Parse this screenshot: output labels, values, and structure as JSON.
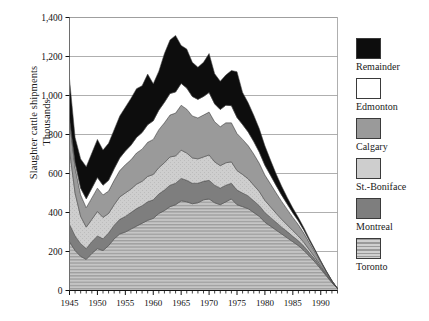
{
  "chart_data": {
    "type": "area",
    "stacked": true,
    "title": "",
    "xlabel": "",
    "ylabel": "Slaughter cattle shipments Thousands",
    "ylabel_lines": [
      "Slaughter cattle shipments",
      "Thousands"
    ],
    "xlim": [
      1945,
      1993
    ],
    "ylim": [
      0,
      1400
    ],
    "ytick_step": 200,
    "xtick_step_major": 5,
    "xtick_step_minor": 1,
    "grid": true,
    "legend_position": "right",
    "ytick_labels": [
      "0",
      "200",
      "400",
      "600",
      "800",
      "1,000",
      "1,200",
      "1,400"
    ],
    "ytick_values": [
      0,
      200,
      400,
      600,
      800,
      1000,
      1200,
      1400
    ],
    "xtick_labels": [
      "1945",
      "1950",
      "1955",
      "1960",
      "1965",
      "1970",
      "1975",
      "1980",
      "1985",
      "1990"
    ],
    "xtick_values": [
      1945,
      1950,
      1955,
      1960,
      1965,
      1970,
      1975,
      1980,
      1985,
      1990
    ],
    "x": [
      1945,
      1946,
      1947,
      1948,
      1949,
      1950,
      1951,
      1952,
      1953,
      1954,
      1955,
      1956,
      1957,
      1958,
      1959,
      1960,
      1961,
      1962,
      1963,
      1964,
      1965,
      1966,
      1967,
      1968,
      1969,
      1970,
      1971,
      1972,
      1973,
      1974,
      1975,
      1976,
      1977,
      1978,
      1979,
      1980,
      1981,
      1982,
      1983,
      1984,
      1985,
      1986,
      1987,
      1988,
      1989,
      1990,
      1991,
      1992,
      1993
    ],
    "series": [
      {
        "name": "Toronto",
        "color": "#b9b9b9",
        "pattern": "horizontal-stripes",
        "values": [
          250,
          205,
          175,
          160,
          190,
          215,
          205,
          230,
          265,
          290,
          300,
          315,
          330,
          345,
          360,
          370,
          395,
          410,
          430,
          440,
          460,
          455,
          445,
          450,
          465,
          470,
          450,
          440,
          455,
          470,
          440,
          430,
          420,
          400,
          380,
          350,
          330,
          310,
          290,
          270,
          250,
          230,
          205,
          175,
          145,
          110,
          75,
          40,
          10
        ]
      },
      {
        "name": "Montreal",
        "color": "#7e7e7e",
        "pattern": "solid",
        "values": [
          90,
          75,
          65,
          55,
          60,
          65,
          60,
          65,
          70,
          75,
          80,
          85,
          90,
          90,
          95,
          95,
          100,
          105,
          110,
          110,
          115,
          110,
          105,
          100,
          95,
          95,
          90,
          85,
          85,
          80,
          75,
          70,
          65,
          60,
          55,
          50,
          45,
          40,
          35,
          32,
          28,
          25,
          22,
          18,
          14,
          10,
          6,
          3,
          0
        ]
      },
      {
        "name": "St.-Boniface",
        "color": "#c8c8c8",
        "pattern": "light-texture",
        "values": [
          380,
          220,
          140,
          110,
          115,
          125,
          110,
          100,
          105,
          115,
          120,
          120,
          125,
          125,
          130,
          130,
          135,
          140,
          145,
          140,
          145,
          140,
          130,
          125,
          125,
          130,
          120,
          115,
          115,
          110,
          100,
          95,
          88,
          80,
          72,
          62,
          54,
          46,
          40,
          34,
          29,
          24,
          19,
          14,
          10,
          7,
          4,
          2,
          0
        ]
      },
      {
        "name": "Calgary",
        "color": "#9a9a9a",
        "pattern": "solid",
        "values": [
          150,
          130,
          110,
          100,
          110,
          120,
          115,
          115,
          125,
          135,
          145,
          150,
          160,
          165,
          175,
          180,
          195,
          205,
          215,
          220,
          230,
          225,
          215,
          210,
          215,
          220,
          205,
          200,
          205,
          200,
          190,
          180,
          170,
          160,
          145,
          130,
          118,
          105,
          92,
          80,
          68,
          58,
          47,
          36,
          26,
          17,
          10,
          4,
          0
        ]
      },
      {
        "name": "Edmonton",
        "color": "#ffffff",
        "pattern": "solid",
        "values": [
          12,
          25,
          35,
          45,
          50,
          55,
          50,
          55,
          60,
          65,
          70,
          75,
          80,
          85,
          90,
          95,
          100,
          105,
          110,
          108,
          112,
          108,
          100,
          95,
          95,
          100,
          92,
          88,
          90,
          88,
          82,
          76,
          70,
          64,
          57,
          50,
          44,
          38,
          32,
          27,
          23,
          19,
          15,
          11,
          8,
          5,
          3,
          1,
          0
        ]
      },
      {
        "name": "Remainder",
        "color": "#0d0d0d",
        "pattern": "solid",
        "values": [
          203,
          130,
          150,
          165,
          180,
          195,
          180,
          190,
          200,
          215,
          225,
          240,
          250,
          240,
          260,
          190,
          200,
          250,
          275,
          290,
          195,
          200,
          175,
          165,
          175,
          200,
          155,
          145,
          155,
          180,
          235,
          165,
          150,
          135,
          120,
          100,
          78,
          60,
          46,
          34,
          25,
          18,
          13,
          9,
          6,
          4,
          2,
          1,
          0
        ]
      }
    ]
  },
  "legend": {
    "items": [
      {
        "label": "Remainder",
        "color": "#0d0d0d",
        "pattern": "solid"
      },
      {
        "label": "Edmonton",
        "color": "#ffffff",
        "pattern": "solid"
      },
      {
        "label": "Calgary",
        "color": "#9a9a9a",
        "pattern": "solid"
      },
      {
        "label": "St.-Boniface",
        "color": "#c8c8c8",
        "pattern": "light-texture"
      },
      {
        "label": "Montreal",
        "color": "#7e7e7e",
        "pattern": "solid"
      },
      {
        "label": "Toronto",
        "color": "#b9b9b9",
        "pattern": "horizontal-stripes"
      }
    ]
  }
}
